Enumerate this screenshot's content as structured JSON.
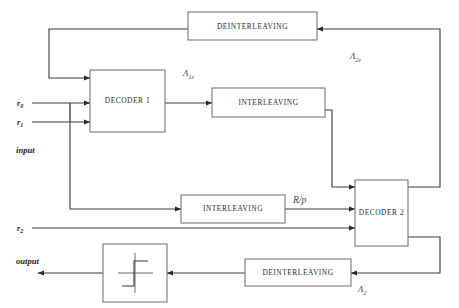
{
  "diagram": {
    "type": "block-diagram",
    "background_color": "#ffffff",
    "line_color": "#3a3a3a",
    "box_stroke_color": "#6e6e6e",
    "text_color": "#2b2b2b"
  },
  "blocks": {
    "deinterleaving_top": {
      "label": "DEINTERLEAVING"
    },
    "decoder1": {
      "label": "DECODER 1"
    },
    "interleaving_top": {
      "label": "INTERLEAVING"
    },
    "interleaving_bottom": {
      "label": "INTERLEAVING"
    },
    "decoder2": {
      "label": "DECODER 2"
    },
    "deinterleaving_bottom": {
      "label": "DEINTERLEAVING"
    },
    "hard_decision": {
      "label": ""
    }
  },
  "signals": {
    "r0": {
      "base": "r",
      "sub": "0"
    },
    "r1": {
      "base": "r",
      "sub": "1"
    },
    "r2": {
      "base": "r",
      "sub": "2"
    },
    "input": {
      "label": "input"
    },
    "output": {
      "label": "output"
    },
    "lambda_1e": {
      "base": "Λ",
      "sub": "1e"
    },
    "lambda_2e": {
      "base": "Λ",
      "sub": "2e"
    },
    "lambda_2": {
      "base": "Λ",
      "sub": "2"
    },
    "rp": {
      "label": "R/p"
    }
  }
}
